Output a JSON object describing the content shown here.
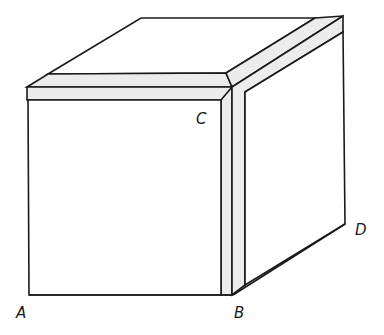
{
  "diagram": {
    "type": "cube-with-corner-band",
    "labels": {
      "A": "A",
      "B": "B",
      "C": "C",
      "D": "D"
    },
    "colors": {
      "stroke": "#1a1a1a",
      "face": "#ffffff",
      "band": "#ececec"
    }
  }
}
